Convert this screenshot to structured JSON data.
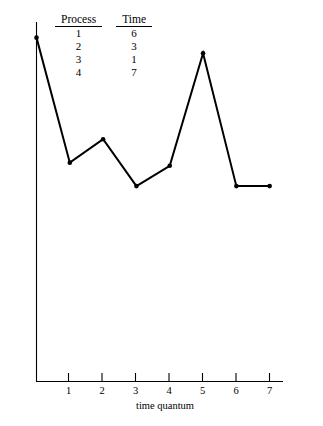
{
  "figure": {
    "background_color": "#ffffff",
    "ink_color": "#000000"
  },
  "table": {
    "headers": [
      "Process",
      "Time"
    ],
    "rows": [
      {
        "process": "1",
        "time": "6"
      },
      {
        "process": "2",
        "time": "3"
      },
      {
        "process": "3",
        "time": "1"
      },
      {
        "process": "4",
        "time": "7"
      }
    ]
  },
  "axes": {
    "xlabel": "time quantum",
    "ylabel": "average turnaround time",
    "xticks": [
      "1",
      "2",
      "3",
      "4",
      "5",
      "6",
      "7"
    ]
  },
  "chart_data": {
    "type": "line",
    "title": "",
    "xlabel": "time quantum",
    "ylabel": "average turnaround time",
    "xlim": [
      0,
      7.4
    ],
    "ylim": [
      0,
      11.5
    ],
    "xticks": [
      1,
      2,
      3,
      4,
      5,
      6,
      7
    ],
    "yticks": [],
    "grid": false,
    "legend": false,
    "marker": "dot",
    "line_color": "#000000",
    "line_width": 2,
    "x": [
      0,
      1,
      2,
      3,
      4,
      5,
      6,
      7
    ],
    "values": [
      11.0,
      7.0,
      7.75,
      6.25,
      6.9,
      10.5,
      6.25,
      6.25
    ],
    "series": [
      {
        "name": "average turnaround time",
        "x": [
          0,
          1,
          2,
          3,
          4,
          5,
          6,
          7
        ],
        "values": [
          11.0,
          7.0,
          7.75,
          6.25,
          6.9,
          10.5,
          6.25,
          6.25
        ]
      }
    ],
    "annotations": [
      "Process 1 burst time 6",
      "Process 2 burst time 3",
      "Process 3 burst time 1",
      "Process 4 burst time 7"
    ]
  }
}
